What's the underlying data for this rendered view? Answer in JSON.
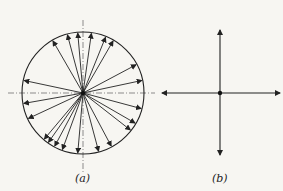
{
  "panels": [
    {
      "id": "a",
      "label": "(a)",
      "description": "Circle with many radial vectors from center (isotropic distribution)",
      "center": [
        83,
        93
      ],
      "radius": 61,
      "vector_angles_deg": [
        95,
        82,
        68,
        60,
        28,
        12,
        -15,
        -30,
        -38,
        -62,
        -75,
        -95,
        -110,
        -118,
        -125,
        -130,
        -155,
        -170,
        168,
        120,
        105
      ]
    },
    {
      "id": "b",
      "label": "(b)",
      "description": "Four orthogonal vectors from a point",
      "center": [
        220,
        93
      ]
    }
  ],
  "colors": {
    "ink": "#222222",
    "background": "#f7f6f2"
  }
}
